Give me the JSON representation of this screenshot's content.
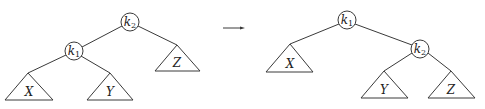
{
  "diagram": {
    "type": "tree-rotation",
    "arrow_symbol": "→",
    "before": {
      "nodes": [
        {
          "id": "k2",
          "letter": "k",
          "sub": "2",
          "role": "root"
        },
        {
          "id": "k1",
          "letter": "k",
          "sub": "1",
          "role": "left-child"
        }
      ],
      "subtrees": [
        {
          "id": "X",
          "label": "X",
          "parent": "k1"
        },
        {
          "id": "Y",
          "label": "Y",
          "parent": "k1"
        },
        {
          "id": "Z",
          "label": "Z",
          "parent": "k2"
        }
      ]
    },
    "after": {
      "nodes": [
        {
          "id": "k1",
          "letter": "k",
          "sub": "1",
          "role": "root"
        },
        {
          "id": "k2",
          "letter": "k",
          "sub": "2",
          "role": "right-child"
        }
      ],
      "subtrees": [
        {
          "id": "X",
          "label": "X",
          "parent": "k1"
        },
        {
          "id": "Y",
          "label": "Y",
          "parent": "k2"
        },
        {
          "id": "Z",
          "label": "Z",
          "parent": "k2"
        }
      ]
    }
  },
  "colors": {
    "stroke": "#3a3a3a",
    "text": "#222222",
    "background": "#ffffff"
  }
}
